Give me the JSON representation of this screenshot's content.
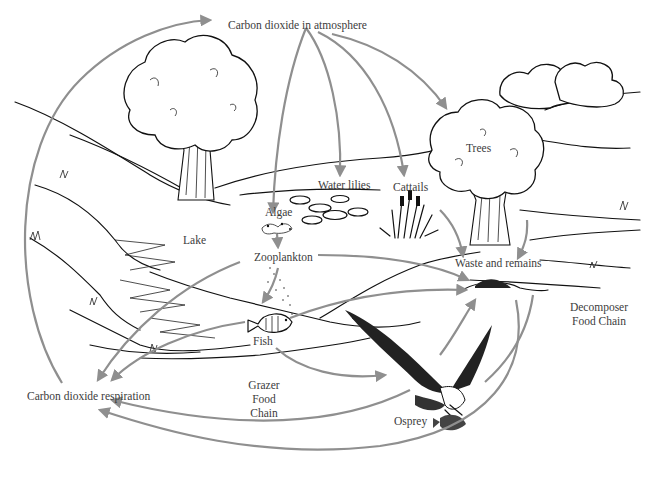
{
  "diagram": {
    "type": "carbon-cycle-food-chain",
    "arrow_color": "#8f8f8f",
    "ink_color": "#111111",
    "background": "#ffffff"
  },
  "labels": {
    "co2_atmosphere": "Carbon dioxide in atmosphere",
    "trees": "Trees",
    "water_lilies": "Water lilies",
    "cattails": "Cattails",
    "algae": "Algae",
    "lake": "Lake",
    "zooplankton": "Zooplankton",
    "waste_remains": "Waste and remains",
    "decomposer_line1": "Decomposer",
    "decomposer_line2": "Food Chain",
    "fish": "Fish",
    "co2_respiration": "Carbon dioxide respiration",
    "grazer_line1": "Grazer",
    "grazer_line2": "Food",
    "grazer_line3": "Chain",
    "osprey": "Osprey"
  },
  "flows": [
    {
      "from": "Carbon dioxide respiration",
      "to": "Carbon dioxide in atmosphere"
    },
    {
      "from": "Carbon dioxide in atmosphere",
      "to": "Algae"
    },
    {
      "from": "Carbon dioxide in atmosphere",
      "to": "Water lilies"
    },
    {
      "from": "Carbon dioxide in atmosphere",
      "to": "Cattails"
    },
    {
      "from": "Carbon dioxide in atmosphere",
      "to": "Trees"
    },
    {
      "from": "Algae",
      "to": "Zooplankton"
    },
    {
      "from": "Zooplankton",
      "to": "Fish"
    },
    {
      "from": "Fish",
      "to": "Osprey"
    },
    {
      "from": "Trees",
      "to": "Waste and remains"
    },
    {
      "from": "Cattails",
      "to": "Waste and remains"
    },
    {
      "from": "Zooplankton",
      "to": "Waste and remains"
    },
    {
      "from": "Fish",
      "to": "Waste and remains"
    },
    {
      "from": "Osprey",
      "to": "Waste and remains"
    },
    {
      "from": "Zooplankton",
      "to": "Carbon dioxide respiration"
    },
    {
      "from": "Fish",
      "to": "Carbon dioxide respiration"
    },
    {
      "from": "Osprey",
      "to": "Carbon dioxide respiration"
    },
    {
      "from": "Waste and remains",
      "to": "Carbon dioxide respiration"
    }
  ]
}
